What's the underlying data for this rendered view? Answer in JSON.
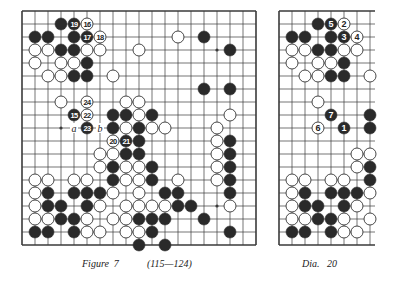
{
  "colors": {
    "line": "#3a3a3a",
    "black_stone": "#2a2a2a",
    "white_stone": "#ffffff",
    "stone_edge": "#333333",
    "paper": "#ffffff"
  },
  "figure": {
    "caption_label": "Figure  7",
    "caption_range": "(115—124)",
    "board": {
      "x0": 22,
      "y0": 11,
      "spacing": 13,
      "cols": 19,
      "rows": 19,
      "right_edge": true
    },
    "star_points": [
      [
        3,
        3
      ],
      [
        3,
        9
      ],
      [
        3,
        15
      ],
      [
        9,
        3
      ],
      [
        9,
        9
      ],
      [
        9,
        15
      ],
      [
        15,
        3
      ],
      [
        15,
        9
      ],
      [
        15,
        15
      ]
    ],
    "stones": [
      {
        "c": 3,
        "r": 1,
        "color": "B"
      },
      {
        "c": 4,
        "r": 1,
        "color": "B",
        "label": "19"
      },
      {
        "c": 5,
        "r": 1,
        "color": "W",
        "label": "16"
      },
      {
        "c": 1,
        "r": 2,
        "color": "B"
      },
      {
        "c": 2,
        "r": 2,
        "color": "B"
      },
      {
        "c": 4,
        "r": 2,
        "color": "B"
      },
      {
        "c": 5,
        "r": 2,
        "color": "B",
        "label": "17"
      },
      {
        "c": 6,
        "r": 2,
        "color": "W",
        "label": "18"
      },
      {
        "c": 12,
        "r": 2,
        "color": "W"
      },
      {
        "c": 14,
        "r": 2,
        "color": "B"
      },
      {
        "c": 1,
        "r": 3,
        "color": "W"
      },
      {
        "c": 2,
        "r": 3,
        "color": "W"
      },
      {
        "c": 3,
        "r": 3,
        "color": "B"
      },
      {
        "c": 4,
        "r": 3,
        "color": "B"
      },
      {
        "c": 5,
        "r": 3,
        "color": "W"
      },
      {
        "c": 6,
        "r": 3,
        "color": "W"
      },
      {
        "c": 9,
        "r": 3,
        "color": "W"
      },
      {
        "c": 16,
        "r": 3,
        "color": "B"
      },
      {
        "c": 1,
        "r": 4,
        "color": "W"
      },
      {
        "c": 3,
        "r": 4,
        "color": "W"
      },
      {
        "c": 4,
        "r": 4,
        "color": "W"
      },
      {
        "c": 5,
        "r": 4,
        "color": "B"
      },
      {
        "c": 2,
        "r": 5,
        "color": "W"
      },
      {
        "c": 3,
        "r": 5,
        "color": "W"
      },
      {
        "c": 4,
        "r": 5,
        "color": "B"
      },
      {
        "c": 5,
        "r": 5,
        "color": "B"
      },
      {
        "c": 7,
        "r": 5,
        "color": "W"
      },
      {
        "c": 14,
        "r": 6,
        "color": "B"
      },
      {
        "c": 16,
        "r": 6,
        "color": "B"
      },
      {
        "c": 3,
        "r": 7,
        "color": "W"
      },
      {
        "c": 5,
        "r": 7,
        "color": "W",
        "label": "24"
      },
      {
        "c": 8,
        "r": 7,
        "color": "W"
      },
      {
        "c": 9,
        "r": 7,
        "color": "W"
      },
      {
        "c": 4,
        "r": 8,
        "color": "B",
        "label": "15"
      },
      {
        "c": 5,
        "r": 8,
        "color": "W",
        "label": "22"
      },
      {
        "c": 7,
        "r": 8,
        "color": "B"
      },
      {
        "c": 8,
        "r": 8,
        "color": "B"
      },
      {
        "c": 9,
        "r": 8,
        "color": "W"
      },
      {
        "c": 10,
        "r": 8,
        "color": "B"
      },
      {
        "c": 16,
        "r": 8,
        "color": "W"
      },
      {
        "c": 5,
        "r": 9,
        "color": "B",
        "label": "23"
      },
      {
        "c": 7,
        "r": 9,
        "color": "B"
      },
      {
        "c": 8,
        "r": 9,
        "color": "W"
      },
      {
        "c": 9,
        "r": 9,
        "color": "B"
      },
      {
        "c": 10,
        "r": 9,
        "color": "W"
      },
      {
        "c": 11,
        "r": 9,
        "color": "W"
      },
      {
        "c": 15,
        "r": 9,
        "color": "W"
      },
      {
        "c": 7,
        "r": 10,
        "color": "W",
        "label": "20"
      },
      {
        "c": 8,
        "r": 10,
        "color": "B",
        "label": "21"
      },
      {
        "c": 9,
        "r": 10,
        "color": "B"
      },
      {
        "c": 15,
        "r": 10,
        "color": "W"
      },
      {
        "c": 16,
        "r": 10,
        "color": "B"
      },
      {
        "c": 6,
        "r": 11,
        "color": "W"
      },
      {
        "c": 7,
        "r": 11,
        "color": "W"
      },
      {
        "c": 8,
        "r": 11,
        "color": "B"
      },
      {
        "c": 9,
        "r": 11,
        "color": "B"
      },
      {
        "c": 15,
        "r": 11,
        "color": "W"
      },
      {
        "c": 16,
        "r": 11,
        "color": "B"
      },
      {
        "c": 6,
        "r": 12,
        "color": "W"
      },
      {
        "c": 7,
        "r": 12,
        "color": "B"
      },
      {
        "c": 8,
        "r": 12,
        "color": "W"
      },
      {
        "c": 9,
        "r": 12,
        "color": "W"
      },
      {
        "c": 10,
        "r": 12,
        "color": "B"
      },
      {
        "c": 15,
        "r": 12,
        "color": "W"
      },
      {
        "c": 16,
        "r": 12,
        "color": "B"
      },
      {
        "c": 1,
        "r": 13,
        "color": "W"
      },
      {
        "c": 2,
        "r": 13,
        "color": "W"
      },
      {
        "c": 4,
        "r": 13,
        "color": "W"
      },
      {
        "c": 5,
        "r": 13,
        "color": "W"
      },
      {
        "c": 7,
        "r": 13,
        "color": "B"
      },
      {
        "c": 8,
        "r": 13,
        "color": "W"
      },
      {
        "c": 9,
        "r": 13,
        "color": "W"
      },
      {
        "c": 10,
        "r": 13,
        "color": "B"
      },
      {
        "c": 12,
        "r": 13,
        "color": "W"
      },
      {
        "c": 15,
        "r": 13,
        "color": "W"
      },
      {
        "c": 16,
        "r": 13,
        "color": "B"
      },
      {
        "c": 1,
        "r": 14,
        "color": "W"
      },
      {
        "c": 2,
        "r": 14,
        "color": "B"
      },
      {
        "c": 4,
        "r": 14,
        "color": "B"
      },
      {
        "c": 5,
        "r": 14,
        "color": "B"
      },
      {
        "c": 6,
        "r": 14,
        "color": "B"
      },
      {
        "c": 7,
        "r": 14,
        "color": "W"
      },
      {
        "c": 9,
        "r": 14,
        "color": "W"
      },
      {
        "c": 11,
        "r": 14,
        "color": "B"
      },
      {
        "c": 12,
        "r": 14,
        "color": "B"
      },
      {
        "c": 16,
        "r": 14,
        "color": "B"
      },
      {
        "c": 1,
        "r": 15,
        "color": "W"
      },
      {
        "c": 2,
        "r": 15,
        "color": "B"
      },
      {
        "c": 3,
        "r": 15,
        "color": "B"
      },
      {
        "c": 5,
        "r": 15,
        "color": "B"
      },
      {
        "c": 6,
        "r": 15,
        "color": "W"
      },
      {
        "c": 8,
        "r": 15,
        "color": "W"
      },
      {
        "c": 9,
        "r": 15,
        "color": "W"
      },
      {
        "c": 10,
        "r": 15,
        "color": "W"
      },
      {
        "c": 11,
        "r": 15,
        "color": "W"
      },
      {
        "c": 12,
        "r": 15,
        "color": "B"
      },
      {
        "c": 13,
        "r": 15,
        "color": "B"
      },
      {
        "c": 16,
        "r": 15,
        "color": "W"
      },
      {
        "c": 1,
        "r": 16,
        "color": "W"
      },
      {
        "c": 2,
        "r": 16,
        "color": "W"
      },
      {
        "c": 3,
        "r": 16,
        "color": "B"
      },
      {
        "c": 4,
        "r": 16,
        "color": "B"
      },
      {
        "c": 5,
        "r": 16,
        "color": "W"
      },
      {
        "c": 7,
        "r": 16,
        "color": "W"
      },
      {
        "c": 8,
        "r": 16,
        "color": "W"
      },
      {
        "c": 9,
        "r": 16,
        "color": "B"
      },
      {
        "c": 10,
        "r": 16,
        "color": "B"
      },
      {
        "c": 11,
        "r": 16,
        "color": "B"
      },
      {
        "c": 14,
        "r": 16,
        "color": "B"
      },
      {
        "c": 1,
        "r": 17,
        "color": "B"
      },
      {
        "c": 2,
        "r": 17,
        "color": "B"
      },
      {
        "c": 4,
        "r": 17,
        "color": "B"
      },
      {
        "c": 5,
        "r": 17,
        "color": "W"
      },
      {
        "c": 6,
        "r": 17,
        "color": "W"
      },
      {
        "c": 8,
        "r": 17,
        "color": "W"
      },
      {
        "c": 9,
        "r": 17,
        "color": "W"
      },
      {
        "c": 10,
        "r": 17,
        "color": "B"
      },
      {
        "c": 16,
        "r": 17,
        "color": "B"
      },
      {
        "c": 9,
        "r": 18,
        "color": "B"
      },
      {
        "c": 11,
        "r": 18,
        "color": "B"
      }
    ],
    "letters": [
      {
        "c": 4,
        "r": 9,
        "text": "a"
      },
      {
        "c": 6,
        "r": 9,
        "text": "b"
      }
    ]
  },
  "diagram": {
    "caption_label": "Dia.   20",
    "board": {
      "x0": 279,
      "y0": 11,
      "spacing": 13,
      "cols": 8,
      "rows": 19,
      "right_edge": false,
      "overhang": 5
    },
    "star_points": [
      [
        3,
        3
      ],
      [
        3,
        9
      ],
      [
        3,
        15
      ]
    ],
    "stones": [
      {
        "c": 3,
        "r": 1,
        "color": "B"
      },
      {
        "c": 4,
        "r": 1,
        "color": "B",
        "label": "5"
      },
      {
        "c": 5,
        "r": 1,
        "color": "W",
        "label": "2"
      },
      {
        "c": 1,
        "r": 2,
        "color": "B"
      },
      {
        "c": 2,
        "r": 2,
        "color": "B"
      },
      {
        "c": 4,
        "r": 2,
        "color": "B"
      },
      {
        "c": 5,
        "r": 2,
        "color": "B",
        "label": "3"
      },
      {
        "c": 6,
        "r": 2,
        "color": "W",
        "label": "4"
      },
      {
        "c": 1,
        "r": 3,
        "color": "W"
      },
      {
        "c": 2,
        "r": 3,
        "color": "W"
      },
      {
        "c": 3,
        "r": 3,
        "color": "B"
      },
      {
        "c": 4,
        "r": 3,
        "color": "B"
      },
      {
        "c": 5,
        "r": 3,
        "color": "W"
      },
      {
        "c": 6,
        "r": 3,
        "color": "W"
      },
      {
        "c": 1,
        "r": 4,
        "color": "W"
      },
      {
        "c": 3,
        "r": 4,
        "color": "W"
      },
      {
        "c": 4,
        "r": 4,
        "color": "W"
      },
      {
        "c": 5,
        "r": 4,
        "color": "B"
      },
      {
        "c": 2,
        "r": 5,
        "color": "W"
      },
      {
        "c": 3,
        "r": 5,
        "color": "W"
      },
      {
        "c": 4,
        "r": 5,
        "color": "B"
      },
      {
        "c": 5,
        "r": 5,
        "color": "B"
      },
      {
        "c": 7,
        "r": 5,
        "color": "W"
      },
      {
        "c": 3,
        "r": 7,
        "color": "W"
      },
      {
        "c": 4,
        "r": 8,
        "color": "B",
        "label": "7"
      },
      {
        "c": 7,
        "r": 8,
        "color": "B"
      },
      {
        "c": 3,
        "r": 9,
        "color": "W",
        "label": "6"
      },
      {
        "c": 5,
        "r": 9,
        "color": "B",
        "label": "1"
      },
      {
        "c": 7,
        "r": 9,
        "color": "B"
      },
      {
        "c": 6,
        "r": 11,
        "color": "W"
      },
      {
        "c": 7,
        "r": 11,
        "color": "W"
      },
      {
        "c": 6,
        "r": 12,
        "color": "W"
      },
      {
        "c": 7,
        "r": 12,
        "color": "B"
      },
      {
        "c": 1,
        "r": 13,
        "color": "W"
      },
      {
        "c": 2,
        "r": 13,
        "color": "W"
      },
      {
        "c": 4,
        "r": 13,
        "color": "W"
      },
      {
        "c": 5,
        "r": 13,
        "color": "W"
      },
      {
        "c": 7,
        "r": 13,
        "color": "B"
      },
      {
        "c": 1,
        "r": 14,
        "color": "W"
      },
      {
        "c": 2,
        "r": 14,
        "color": "B"
      },
      {
        "c": 4,
        "r": 14,
        "color": "B"
      },
      {
        "c": 5,
        "r": 14,
        "color": "B"
      },
      {
        "c": 6,
        "r": 14,
        "color": "B"
      },
      {
        "c": 7,
        "r": 14,
        "color": "W"
      },
      {
        "c": 1,
        "r": 15,
        "color": "W"
      },
      {
        "c": 2,
        "r": 15,
        "color": "B"
      },
      {
        "c": 3,
        "r": 15,
        "color": "B"
      },
      {
        "c": 5,
        "r": 15,
        "color": "B"
      },
      {
        "c": 6,
        "r": 15,
        "color": "W"
      },
      {
        "c": 1,
        "r": 16,
        "color": "W"
      },
      {
        "c": 2,
        "r": 16,
        "color": "W"
      },
      {
        "c": 3,
        "r": 16,
        "color": "B"
      },
      {
        "c": 4,
        "r": 16,
        "color": "B"
      },
      {
        "c": 5,
        "r": 16,
        "color": "W"
      },
      {
        "c": 7,
        "r": 16,
        "color": "W"
      },
      {
        "c": 1,
        "r": 17,
        "color": "B"
      },
      {
        "c": 2,
        "r": 17,
        "color": "B"
      },
      {
        "c": 4,
        "r": 17,
        "color": "B"
      },
      {
        "c": 5,
        "r": 17,
        "color": "W"
      },
      {
        "c": 6,
        "r": 17,
        "color": "W"
      }
    ],
    "letters": []
  }
}
